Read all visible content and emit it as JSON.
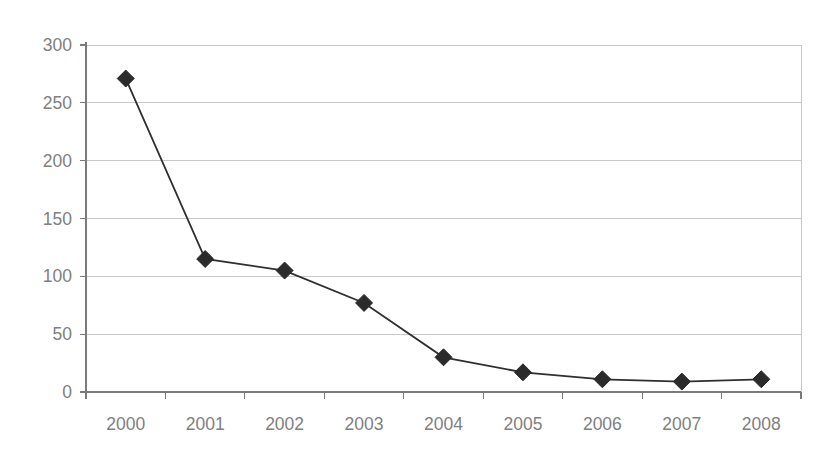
{
  "page": {
    "title_fragment_clipped": "chart title cut off at top edge",
    "background_color": "#ffffff"
  },
  "chart_data": {
    "type": "line",
    "title": "",
    "subtitle": "",
    "xlabel": "",
    "ylabel": "",
    "categories": [
      "2000",
      "2001",
      "2002",
      "2003",
      "2004",
      "2005",
      "2006",
      "2007",
      "2008"
    ],
    "values": [
      271,
      115,
      105,
      77,
      30,
      17,
      11,
      9,
      11
    ],
    "series": [
      {
        "name": "",
        "values": [
          271,
          115,
          105,
          77,
          30,
          17,
          11,
          9,
          11
        ],
        "line_color": "#2f2f2f",
        "marker": "diamond",
        "marker_color": "#2b2b2b"
      }
    ],
    "ylim": [
      0,
      300
    ],
    "yticks": [
      0,
      50,
      100,
      150,
      200,
      250,
      300
    ],
    "ytick_labels": [
      "0",
      "50",
      "100",
      "150",
      "200",
      "250",
      "300"
    ],
    "xtick_labels": [
      "2000",
      "2001",
      "2002",
      "2003",
      "2004",
      "2005",
      "2006",
      "2007",
      "2008"
    ],
    "grid": {
      "horizontal": true,
      "vertical": false,
      "color": "#c8c8c8"
    },
    "legend": {
      "visible": false,
      "position": "none"
    },
    "axis_color": "#7a7a7a",
    "tick_label_color": "#808080"
  }
}
